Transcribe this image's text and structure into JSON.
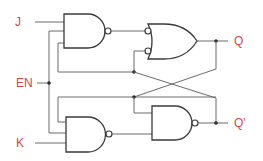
{
  "diagram": {
    "type": "logic-circuit",
    "colors": {
      "label": "#d9434a",
      "wire": "#6b6b6b",
      "gate_outline": "#3a3a3a"
    },
    "inputs": {
      "j": "J",
      "en": "EN",
      "k": "K"
    },
    "outputs": {
      "q": "Q",
      "q_bar": "Q'"
    },
    "gates": [
      {
        "id": "nand-top-left",
        "type": "NAND",
        "inputs": [
          "J",
          "EN",
          "Q' feedback"
        ]
      },
      {
        "id": "or-top-right",
        "type": "OR (inverted inputs)",
        "inputs": [
          "nand-top-left",
          "Q' cross-coupled"
        ],
        "output": "Q"
      },
      {
        "id": "nand-bottom-left",
        "type": "NAND",
        "inputs": [
          "Q feedback",
          "EN",
          "K"
        ]
      },
      {
        "id": "nand-bottom-right",
        "type": "NAND",
        "inputs": [
          "Q cross-coupled",
          "nand-bottom-left"
        ],
        "output": "Q'"
      }
    ]
  }
}
